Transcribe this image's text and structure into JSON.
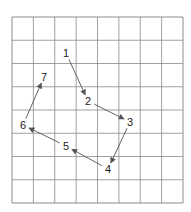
{
  "grid": {
    "x0": 12,
    "y0": 17,
    "x1": 183,
    "y1": 203,
    "cols": 8,
    "rows": 8,
    "line_color": "#8a8a8a",
    "border_color": "#6e6e6e"
  },
  "arrow_color": "#555555",
  "points": [
    {
      "label": "1",
      "x": 66,
      "y": 53
    },
    {
      "label": "2",
      "x": 88,
      "y": 101
    },
    {
      "label": "3",
      "x": 130,
      "y": 122
    },
    {
      "label": "4",
      "x": 108,
      "y": 169
    },
    {
      "label": "5",
      "x": 66,
      "y": 146
    },
    {
      "label": "6",
      "x": 23,
      "y": 125
    },
    {
      "label": "7",
      "x": 44,
      "y": 77
    }
  ],
  "arrows": [
    {
      "from": 0,
      "to": 1
    },
    {
      "from": 1,
      "to": 2
    },
    {
      "from": 2,
      "to": 3
    },
    {
      "from": 3,
      "to": 4
    },
    {
      "from": 4,
      "to": 5
    },
    {
      "from": 5,
      "to": 6
    }
  ]
}
